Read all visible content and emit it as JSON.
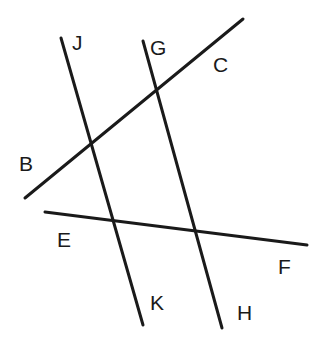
{
  "diagram": {
    "stroke_color": "#1a1a1a",
    "stroke_width": 3,
    "lines": [
      {
        "id": "BC",
        "x1": 25,
        "y1": 198,
        "x2": 243,
        "y2": 19
      },
      {
        "id": "JK",
        "x1": 61,
        "y1": 38,
        "x2": 143,
        "y2": 325
      },
      {
        "id": "GH",
        "x1": 143,
        "y1": 41,
        "x2": 222,
        "y2": 328
      },
      {
        "id": "EF",
        "x1": 45,
        "y1": 212,
        "x2": 307,
        "y2": 245
      }
    ],
    "labels": {
      "J": "J",
      "G": "G",
      "C": "C",
      "B": "B",
      "E": "E",
      "F": "F",
      "K": "K",
      "H": "H"
    }
  }
}
